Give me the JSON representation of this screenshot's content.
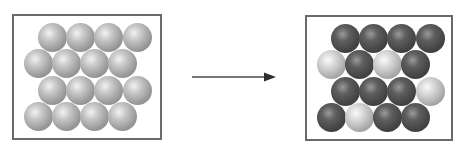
{
  "diagram": {
    "type": "before-after particle substitution",
    "ball_radius": 14.5,
    "colors": {
      "border": "#6a6a6a",
      "arrow": "#4a4a4a"
    },
    "left_panel": {
      "box": {
        "x": 12,
        "y": 14,
        "w": 150,
        "h": 126
      },
      "rows": [
        {
          "y": 37,
          "xs": [
            52,
            80,
            108,
            137
          ],
          "kinds": [
            "light",
            "light",
            "light",
            "light"
          ]
        },
        {
          "y": 63,
          "xs": [
            38,
            66,
            94,
            122
          ],
          "kinds": [
            "light",
            "light",
            "light",
            "light"
          ]
        },
        {
          "y": 90,
          "xs": [
            52,
            80,
            108,
            137
          ],
          "kinds": [
            "light",
            "light",
            "light",
            "light"
          ]
        },
        {
          "y": 116,
          "xs": [
            38,
            66,
            94,
            122
          ],
          "kinds": [
            "light",
            "light",
            "light",
            "light"
          ]
        }
      ]
    },
    "arrow": {
      "x1": 192,
      "y": 77,
      "x2": 276
    },
    "right_panel": {
      "box": {
        "x": 305,
        "y": 15,
        "w": 148,
        "h": 126
      },
      "rows": [
        {
          "y": 38,
          "xs": [
            345,
            373,
            401,
            430
          ],
          "kinds": [
            "dark",
            "dark",
            "dark",
            "dark"
          ]
        },
        {
          "y": 64,
          "xs": [
            331,
            359,
            387,
            415
          ],
          "kinds": [
            "lightalt",
            "dark",
            "lightalt",
            "dark"
          ]
        },
        {
          "y": 91,
          "xs": [
            345,
            373,
            401,
            430
          ],
          "kinds": [
            "dark",
            "dark",
            "dark",
            "lightalt"
          ]
        },
        {
          "y": 117,
          "xs": [
            331,
            359,
            387,
            415
          ],
          "kinds": [
            "dark",
            "lightalt",
            "dark",
            "dark"
          ]
        }
      ]
    }
  }
}
